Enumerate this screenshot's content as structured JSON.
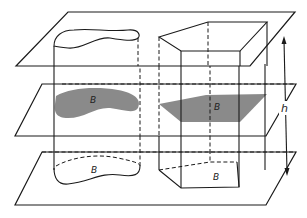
{
  "figure": {
    "solids": [
      {
        "name": "generalized-cylinder",
        "cross_section_label": "B",
        "base_label": "B"
      },
      {
        "name": "pentagonal-prism",
        "cross_section_label": "B",
        "base_label": "B"
      }
    ],
    "planes": [
      "top-plane",
      "middle-plane",
      "bottom-plane"
    ],
    "height_label": "h",
    "colors": {
      "line": "#1a1a1a",
      "cross_section_fill": "#8a8a8a",
      "background": "#ffffff"
    }
  },
  "labels": {
    "cyl_section": "B",
    "cyl_base": "B",
    "prism_section": "B",
    "prism_base": "B",
    "height": "h"
  }
}
